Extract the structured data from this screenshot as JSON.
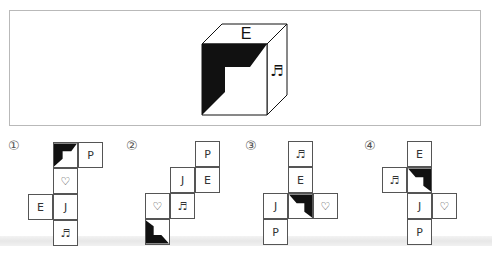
{
  "question": {
    "cube": {
      "top_face": "E",
      "right_face": "♬",
      "front_face": "shaded-l-shape"
    }
  },
  "options": [
    {
      "label": "①",
      "cells": [
        {
          "row": 0,
          "col": 1,
          "content": "",
          "type": "shaded",
          "rotation": 0
        },
        {
          "row": 0,
          "col": 2,
          "content": "P",
          "type": "text"
        },
        {
          "row": 1,
          "col": 1,
          "content": "♡",
          "type": "text"
        },
        {
          "row": 2,
          "col": 0,
          "content": "E",
          "type": "text"
        },
        {
          "row": 2,
          "col": 1,
          "content": "J",
          "type": "text"
        },
        {
          "row": 3,
          "col": 1,
          "content": "♬",
          "type": "text"
        }
      ]
    },
    {
      "label": "②",
      "cells": [
        {
          "row": 0,
          "col": 2,
          "content": "P",
          "type": "text"
        },
        {
          "row": 1,
          "col": 1,
          "content": "J",
          "type": "text"
        },
        {
          "row": 1,
          "col": 2,
          "content": "E",
          "type": "text"
        },
        {
          "row": 2,
          "col": 0,
          "content": "♡",
          "type": "text"
        },
        {
          "row": 2,
          "col": 1,
          "content": "♬",
          "type": "text"
        },
        {
          "row": 3,
          "col": 0,
          "content": "",
          "type": "shaded",
          "rotation": 270
        }
      ]
    },
    {
      "label": "③",
      "cells": [
        {
          "row": 0,
          "col": 1,
          "content": "♬",
          "type": "text"
        },
        {
          "row": 1,
          "col": 1,
          "content": "E",
          "type": "text"
        },
        {
          "row": 2,
          "col": 0,
          "content": "J",
          "type": "text"
        },
        {
          "row": 2,
          "col": 1,
          "content": "",
          "type": "shaded",
          "rotation": 90
        },
        {
          "row": 2,
          "col": 2,
          "content": "♡",
          "type": "text"
        },
        {
          "row": 3,
          "col": 0,
          "content": "P",
          "type": "text"
        }
      ]
    },
    {
      "label": "④",
      "cells": [
        {
          "row": 0,
          "col": 1,
          "content": "E",
          "type": "text"
        },
        {
          "row": 1,
          "col": 0,
          "content": "♬",
          "type": "text"
        },
        {
          "row": 1,
          "col": 1,
          "content": "",
          "type": "shaded",
          "rotation": 90
        },
        {
          "row": 2,
          "col": 1,
          "content": "J",
          "type": "text"
        },
        {
          "row": 2,
          "col": 2,
          "content": "♡",
          "type": "text"
        },
        {
          "row": 3,
          "col": 1,
          "content": "P",
          "type": "text"
        }
      ]
    }
  ]
}
